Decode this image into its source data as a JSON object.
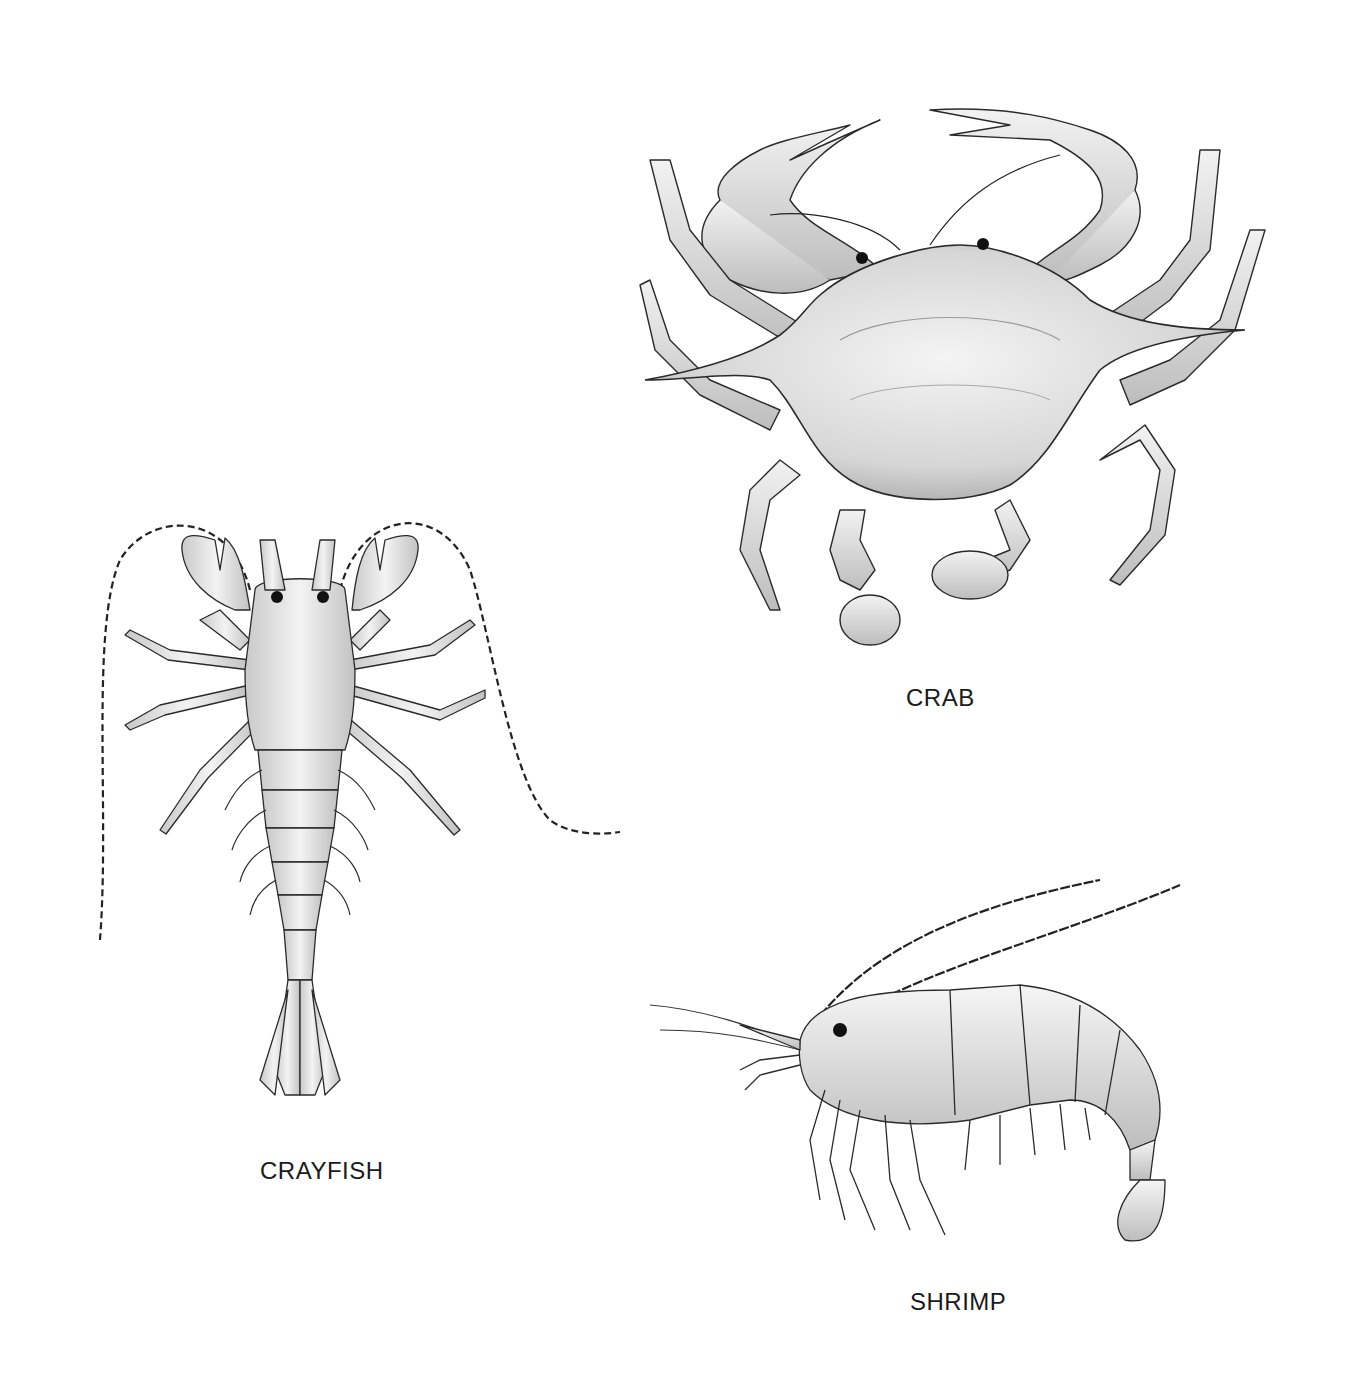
{
  "plate": {
    "figures": [
      {
        "id": "crab",
        "label": "CRAB"
      },
      {
        "id": "crayfish",
        "label": "CRAYFISH"
      },
      {
        "id": "shrimp",
        "label": "SHRIMP"
      }
    ],
    "colors": {
      "background": "#ffffff",
      "ink": "#1a1a1a",
      "shade": "#cfcfcf",
      "fill": "#eeeeee"
    }
  }
}
